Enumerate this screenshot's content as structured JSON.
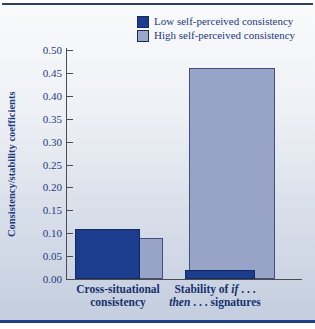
{
  "figure": {
    "top_rule_color": "#2e4157",
    "bottom_rule_color": "#1e4186",
    "panel_bg_top": "#f9fafc",
    "panel_bg_bottom": "#c4cedf",
    "text_color": "#1e3a7d"
  },
  "legend": {
    "items": [
      {
        "label": "Low self-perceived consistency",
        "color": "#1c3c8e"
      },
      {
        "label": "High self-perceived consistency",
        "color": "#9aa7c9"
      }
    ]
  },
  "chart_data": {
    "type": "bar",
    "title": "",
    "categories": [
      "Cross-situational consistency",
      "Stability of if . . . then . . . signatures"
    ],
    "series": [
      {
        "name": "Low self-perceived consistency",
        "color": "#1c3c8e",
        "values": [
          0.11,
          0.02
        ]
      },
      {
        "name": "High self-perceived consistency",
        "color": "#97a4c8",
        "values": [
          0.09,
          0.46
        ]
      }
    ],
    "xlabel": "",
    "ylabel": "Consistency/stability coefficients",
    "ylim": [
      0,
      0.5
    ],
    "ytick_step": 0.05,
    "ytick_decimals": 2,
    "grid": false,
    "legend_position": "top-right",
    "x_tick_labels_rich": [
      {
        "lines": [
          [
            {
              "text": "Cross-situational"
            }
          ],
          [
            {
              "text": "consistency"
            }
          ]
        ]
      },
      {
        "lines": [
          [
            {
              "text": "Stability of "
            },
            {
              "text": "if",
              "italic": true
            },
            {
              "text": " . . ."
            }
          ],
          [
            {
              "text": "then",
              "italic": true
            },
            {
              "text": " . . . signatures"
            }
          ]
        ]
      }
    ]
  }
}
